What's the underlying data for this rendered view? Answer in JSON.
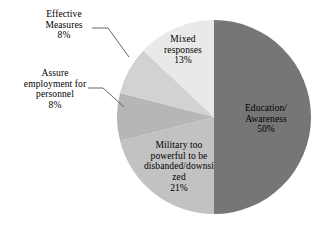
{
  "chart_data": {
    "type": "pie",
    "title": "",
    "subtitle": "",
    "xlabel": "",
    "ylabel": "",
    "legend": "none",
    "grid": false,
    "label_format": "category name with percentage",
    "start_angle_deg": 0,
    "direction": "clockwise",
    "categories": [
      "Education/Awareness",
      "Military too powerful to be disbanded/downsized",
      "Assure employment for personnel",
      "Effective Measures",
      "Mixed responses"
    ],
    "values": [
      50,
      21,
      8,
      8,
      13
    ],
    "units": "percent",
    "slices": [
      {
        "name": "education-awareness",
        "label_lines": [
          "Education/",
          "Awareness"
        ],
        "percent_text": "50%",
        "value": 50,
        "color": "#767676",
        "label_placement": "inside",
        "start_deg": 0,
        "end_deg": 180
      },
      {
        "name": "military-too-powerful",
        "label_lines": [
          "Military too",
          "powerful to be",
          "disbanded/downsi",
          "zed"
        ],
        "percent_text": "21%",
        "value": 21,
        "color": "#c2c2c2",
        "label_placement": "inside",
        "start_deg": 180,
        "end_deg": 255.6
      },
      {
        "name": "assure-employment",
        "label_lines": [
          "Assure",
          "employment for",
          "personnel"
        ],
        "percent_text": "8%",
        "value": 8,
        "color": "#b6b6b6",
        "label_placement": "outside",
        "start_deg": 255.6,
        "end_deg": 284.4
      },
      {
        "name": "effective-measures",
        "label_lines": [
          "Effective",
          "Measures"
        ],
        "percent_text": "8%",
        "value": 8,
        "color": "#d2d2d2",
        "label_placement": "outside",
        "start_deg": 284.4,
        "end_deg": 313.2
      },
      {
        "name": "mixed-responses",
        "label_lines": [
          "Mixed",
          "responses"
        ],
        "percent_text": "13%",
        "value": 13,
        "color": "#e9e9e9",
        "label_placement": "inside",
        "start_deg": 313.2,
        "end_deg": 360
      }
    ],
    "background_color": "#ffffff",
    "text_color": "#000000",
    "leader_line_color": "#555555"
  }
}
